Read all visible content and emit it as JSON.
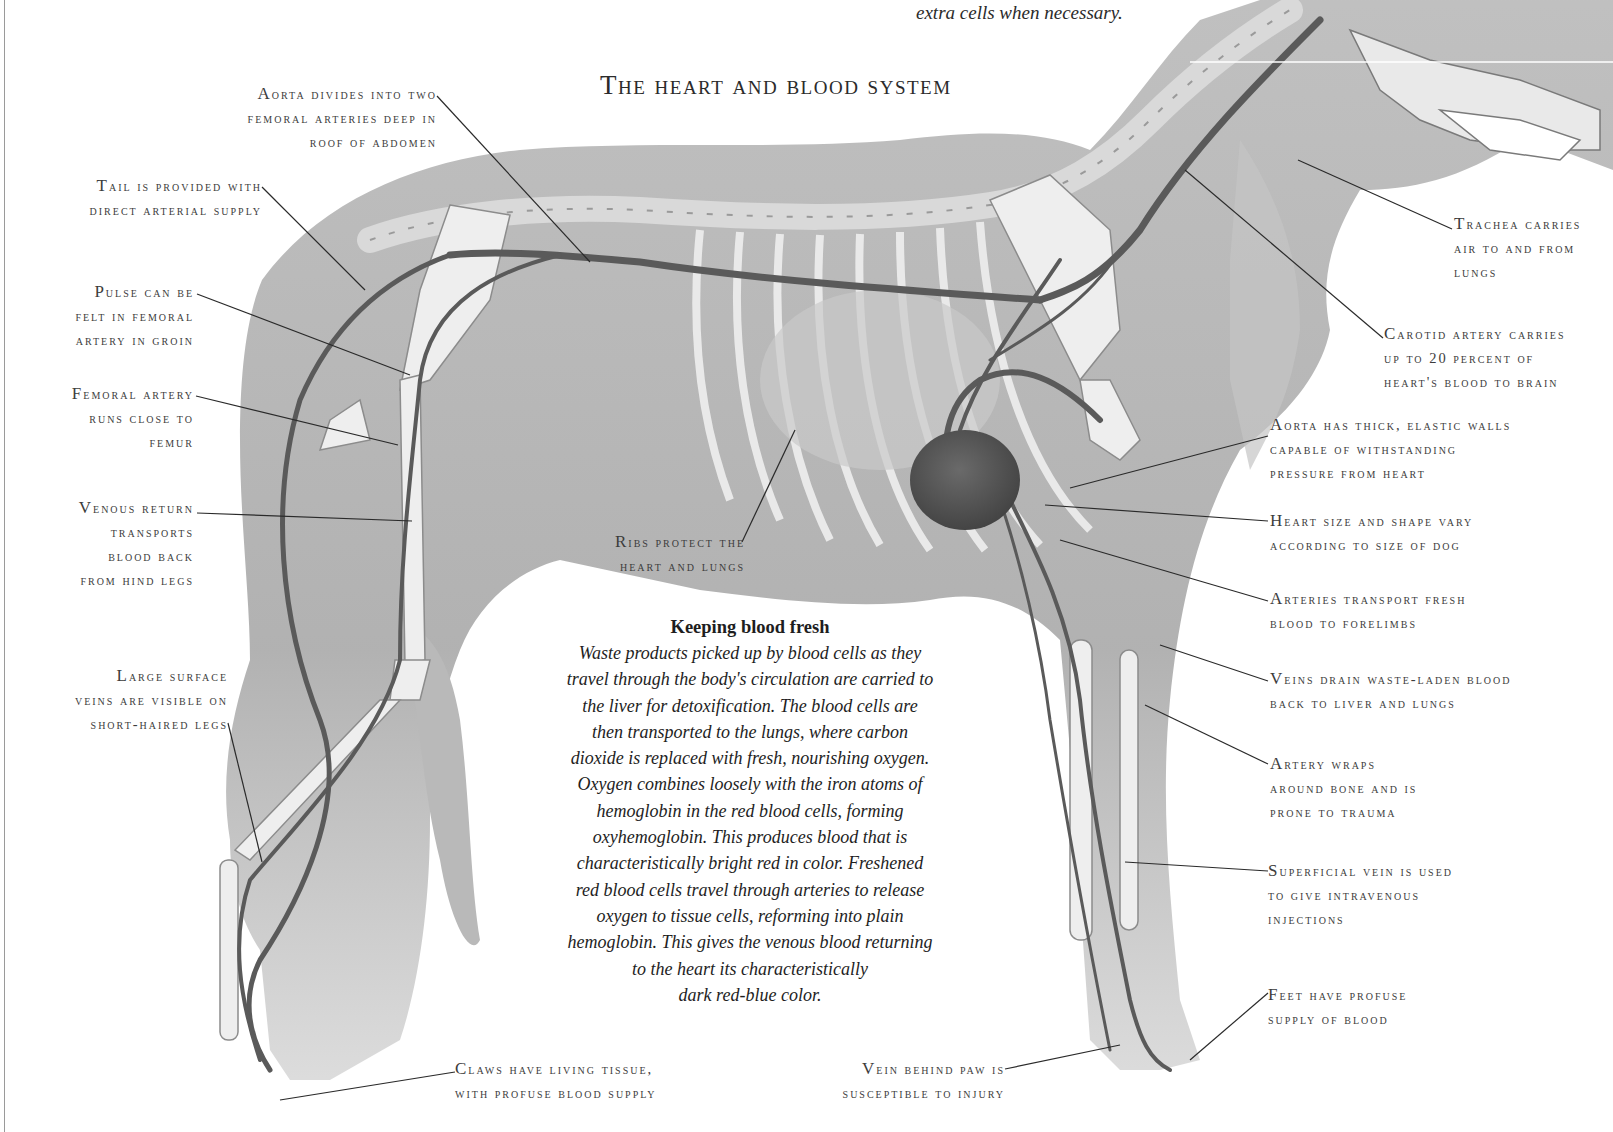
{
  "page": {
    "top_caption": "extra cells when necessary.",
    "title": "The heart and blood system"
  },
  "labels_left": [
    {
      "id": "aorta-divides",
      "lines": [
        "Aorta divides into two",
        "femoral arteries deep in",
        "roof of abdomen"
      ]
    },
    {
      "id": "tail-supply",
      "lines": [
        "Tail is provided with",
        "direct arterial supply"
      ]
    },
    {
      "id": "pulse",
      "lines": [
        "Pulse can be",
        "felt in femoral",
        "artery in groin"
      ]
    },
    {
      "id": "femoral-artery",
      "lines": [
        "Femoral artery",
        "runs close to",
        "femur"
      ]
    },
    {
      "id": "venous-return",
      "lines": [
        "Venous return",
        "transports",
        "blood back",
        "from hind legs"
      ]
    },
    {
      "id": "surface-veins",
      "lines": [
        "Large surface",
        "veins are visible on",
        "short-haired legs"
      ]
    }
  ],
  "labels_right": [
    {
      "id": "trachea",
      "lines": [
        "Trachea carries",
        "air to and from",
        "lungs"
      ]
    },
    {
      "id": "carotid",
      "lines": [
        "Carotid artery carries",
        "up to 20 percent of",
        "heart's blood to brain"
      ]
    },
    {
      "id": "aorta-walls",
      "lines": [
        "Aorta has thick, elastic walls",
        "capable of withstanding",
        "pressure from heart"
      ]
    },
    {
      "id": "heart-size",
      "lines": [
        "Heart size and shape vary",
        "according to size of dog"
      ]
    },
    {
      "id": "forelimb-arteries",
      "lines": [
        "Arteries transport fresh",
        "blood to forelimbs"
      ]
    },
    {
      "id": "veins-drain",
      "lines": [
        "Veins drain waste-laden blood",
        "back to liver and lungs"
      ]
    },
    {
      "id": "artery-wraps",
      "lines": [
        "Artery wraps",
        "around bone and is",
        "prone to trauma"
      ]
    },
    {
      "id": "superficial-vein",
      "lines": [
        "Superficial vein is used",
        "to give intravenous",
        "injections"
      ]
    },
    {
      "id": "feet",
      "lines": [
        "Feet have profuse",
        "supply of blood"
      ]
    }
  ],
  "labels_center": [
    {
      "id": "ribs",
      "lines": [
        "Ribs protect the",
        "heart and lungs"
      ]
    },
    {
      "id": "claws",
      "lines": [
        "Claws have living tissue,",
        "with profuse blood supply"
      ]
    },
    {
      "id": "vein-paw",
      "lines": [
        "Vein behind paw is",
        "susceptible to injury"
      ]
    }
  ],
  "sidebar": {
    "heading": "Keeping blood fresh",
    "lines": [
      "Waste products picked up by blood cells as they",
      "travel through the body's circulation are carried to",
      "the liver for detoxification. The blood cells are",
      "then transported to the lungs, where carbon",
      "dioxide is replaced with fresh, nourishing oxygen.",
      "Oxygen combines loosely with the iron atoms of",
      "hemoglobin in the red blood cells, forming",
      "oxyhemoglobin. This produces blood that is",
      "characteristically bright red in color. Freshened",
      "red blood cells travel through arteries to release",
      "oxygen to tissue cells, reforming into plain",
      "hemoglobin. This gives the venous blood returning",
      "to the heart its characteristically",
      "dark red-blue color."
    ]
  },
  "colors": {
    "fur": "#a8a8a8",
    "fur_light": "#cfcfcf",
    "bone": "#e6e6e6",
    "vessel": "#5a5a5a",
    "heart": "#555555",
    "leader_line": "#2a2a2a",
    "text": "#3c3c3c"
  }
}
